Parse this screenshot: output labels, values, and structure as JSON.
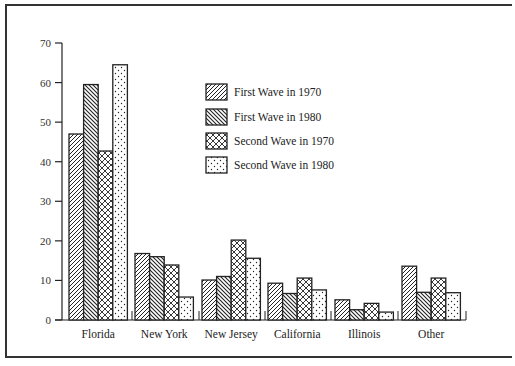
{
  "chart_data": {
    "type": "bar",
    "title": "",
    "xlabel": "",
    "ylabel": "",
    "ylim": [
      0,
      70
    ],
    "yticks": [
      0,
      10,
      20,
      30,
      40,
      50,
      60,
      70
    ],
    "grid": false,
    "legend_position": "upper center",
    "categories": [
      "Florida",
      "New York",
      "New Jersey",
      "California",
      "Illinois",
      "Other"
    ],
    "series": [
      {
        "name": "First Wave in 1970",
        "pattern": "diagonal-up",
        "values": [
          47.0,
          16.8,
          10.1,
          9.3,
          5.1,
          13.6
        ]
      },
      {
        "name": "First Wave in 1980",
        "pattern": "diagonal-down",
        "values": [
          59.5,
          16.0,
          11.0,
          6.7,
          2.6,
          7.0
        ]
      },
      {
        "name": "Second Wave in 1970",
        "pattern": "crosshatch",
        "values": [
          42.7,
          13.9,
          20.2,
          10.6,
          4.2,
          10.6
        ]
      },
      {
        "name": "Second Wave in 1980",
        "pattern": "dots",
        "values": [
          64.5,
          5.8,
          15.6,
          7.6,
          2.0,
          6.9
        ]
      }
    ]
  },
  "colors": {
    "ink": "#222222",
    "frame": "#333333",
    "background": "#ffffff"
  }
}
